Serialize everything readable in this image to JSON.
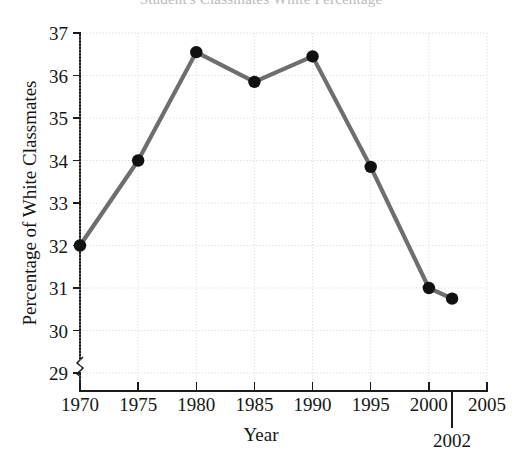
{
  "chart_data": {
    "type": "line",
    "title": "Student's Classmates White Percentage",
    "xlabel": "Year",
    "ylabel": "Percentage of White Classmates",
    "x": [
      1970,
      1975,
      1980,
      1985,
      1990,
      1995,
      2000,
      2002
    ],
    "values": [
      32.0,
      34.0,
      36.55,
      35.85,
      36.45,
      33.85,
      31.0,
      30.75
    ],
    "series": [
      {
        "name": "Percentage of White Classmates",
        "values": [
          32.0,
          34.0,
          36.55,
          35.85,
          36.45,
          33.85,
          31.0,
          30.75
        ]
      }
    ],
    "xlim": [
      1970,
      2005
    ],
    "ylim": [
      28.6,
      37
    ],
    "xticks": [
      "1970",
      "1975",
      "1980",
      "1985",
      "1990",
      "1995",
      "2000",
      "2005"
    ],
    "xtick_values": [
      1970,
      1975,
      1980,
      1985,
      1990,
      1995,
      2000,
      2005
    ],
    "yticks": [
      "29",
      "30",
      "31",
      "32",
      "33",
      "34",
      "35",
      "36",
      "37"
    ],
    "ytick_values": [
      29,
      30,
      31,
      32,
      33,
      34,
      35,
      36,
      37
    ],
    "grid": true,
    "legend": null,
    "y_axis_break": true,
    "annotations": [
      {
        "label": "2002",
        "x": 2002,
        "kind": "x-axis-callout"
      }
    ],
    "line_color": "#6e6e6e",
    "marker_color": "#111111",
    "grid_color": "#d4d4dd",
    "axis_color": "#1b1b1b",
    "background": "#ffffff"
  }
}
